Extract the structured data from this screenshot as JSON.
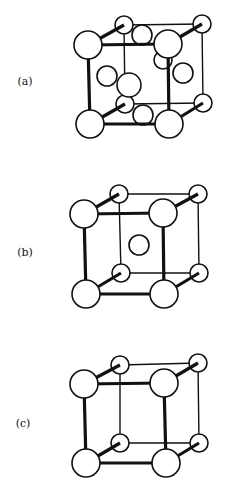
{
  "figure": {
    "panels": [
      {
        "id": "a",
        "label": "(a)",
        "structure": "face-centered cubic",
        "label_pos": [
          25,
          85
        ],
        "corners": {
          "ftl": [
            88,
            45
          ],
          "ftr": [
            168,
            44
          ],
          "fbl": [
            90,
            124
          ],
          "fbr": [
            169,
            124
          ],
          "btl": [
            124,
            25
          ],
          "btr": [
            202,
            24
          ],
          "bbl": [
            125,
            104
          ],
          "bbr": [
            203,
            103
          ]
        },
        "extra_atoms": [
          {
            "name": "top-face",
            "c": [
              142,
              35
            ],
            "r": 10
          },
          {
            "name": "bottom-face",
            "c": [
              143,
              115
            ],
            "r": 10
          },
          {
            "name": "back-face",
            "c": [
              163,
              60
            ],
            "r": 9
          },
          {
            "name": "left-face",
            "c": [
              107,
              76
            ],
            "r": 10
          },
          {
            "name": "right-face",
            "c": [
              183,
              73
            ],
            "r": 10
          },
          {
            "name": "front-face",
            "c": [
              129,
              85
            ],
            "r": 12
          }
        ]
      },
      {
        "id": "b",
        "label": "(b)",
        "structure": "body-centered cubic",
        "label_pos": [
          25,
          256
        ],
        "corners": {
          "ftl": [
            84,
            214
          ],
          "ftr": [
            163,
            213
          ],
          "fbl": [
            86,
            294
          ],
          "fbr": [
            164,
            294
          ],
          "btl": [
            119,
            194
          ],
          "btr": [
            198,
            194
          ],
          "bbl": [
            121,
            273
          ],
          "bbr": [
            199,
            273
          ]
        },
        "extra_atoms": [
          {
            "name": "body-center",
            "c": [
              139,
              245
            ],
            "r": 10
          }
        ]
      },
      {
        "id": "c",
        "label": "(c)",
        "structure": "simple cubic",
        "label_pos": [
          23,
          427
        ],
        "corners": {
          "ftl": [
            84,
            384
          ],
          "ftr": [
            164,
            383
          ],
          "fbl": [
            86,
            463
          ],
          "fbr": [
            166,
            463
          ],
          "btl": [
            120,
            365
          ],
          "btr": [
            198,
            363
          ],
          "bbl": [
            120,
            443
          ],
          "bbr": [
            199,
            443
          ]
        },
        "extra_atoms": []
      }
    ],
    "front_atom_radius": 14,
    "back_atom_radius": 9
  }
}
